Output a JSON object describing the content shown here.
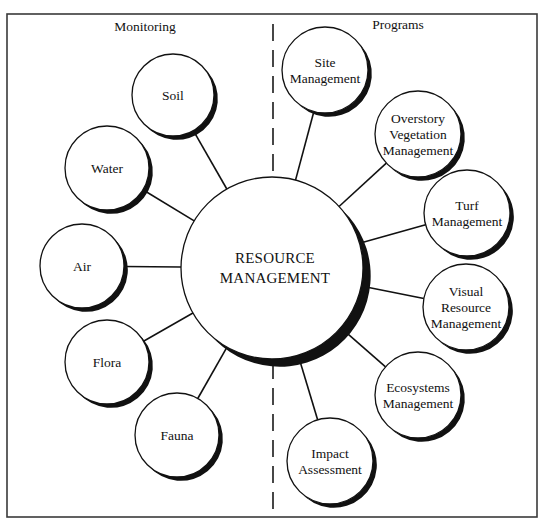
{
  "sections": {
    "left": {
      "label": "Monitoring"
    },
    "right": {
      "label": "Programs"
    }
  },
  "hub": {
    "lines": [
      "RESOURCE",
      "MANAGEMENT"
    ],
    "cx": 272,
    "cy": 268,
    "r": 91
  },
  "monitoring": [
    {
      "id": "soil",
      "lines": [
        "Soil"
      ],
      "cx": 173,
      "cy": 95,
      "r": 41
    },
    {
      "id": "water",
      "lines": [
        "Water"
      ],
      "cx": 107,
      "cy": 168,
      "r": 42
    },
    {
      "id": "air",
      "lines": [
        "Air"
      ],
      "cx": 82,
      "cy": 266,
      "r": 42
    },
    {
      "id": "flora",
      "lines": [
        "Flora"
      ],
      "cx": 107,
      "cy": 362,
      "r": 42
    },
    {
      "id": "fauna",
      "lines": [
        "Fauna"
      ],
      "cx": 177,
      "cy": 435,
      "r": 42
    }
  ],
  "programs": [
    {
      "id": "site-management",
      "lines": [
        "Site",
        "Management"
      ],
      "cx": 325,
      "cy": 70,
      "r": 43
    },
    {
      "id": "overstory-vegetation-management",
      "lines": [
        "Overstory",
        "Vegetation",
        "Management"
      ],
      "cx": 418,
      "cy": 134,
      "r": 43
    },
    {
      "id": "turf-management",
      "lines": [
        "Turf",
        "Management"
      ],
      "cx": 467,
      "cy": 213,
      "r": 43
    },
    {
      "id": "visual-resource-management",
      "lines": [
        "Visual",
        "Resource",
        "Management"
      ],
      "cx": 466,
      "cy": 307,
      "r": 43
    },
    {
      "id": "ecosystems-management",
      "lines": [
        "Ecosystems",
        "Management"
      ],
      "cx": 418,
      "cy": 395,
      "r": 43
    },
    {
      "id": "impact-assessment",
      "lines": [
        "Impact",
        "Assessment"
      ],
      "cx": 330,
      "cy": 461,
      "r": 43
    }
  ],
  "frame": {
    "x": 7,
    "y": 14,
    "w": 530,
    "h": 503
  },
  "divider": {
    "x": 273,
    "y1": 24,
    "y2": 512
  },
  "colors": {
    "stroke": "#111111",
    "background": "#ffffff",
    "frame": "#3a3a3a"
  }
}
